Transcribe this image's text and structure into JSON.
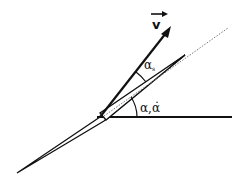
{
  "diagram": {
    "title": "",
    "labels": {
      "velocity": "v",
      "angle_slip": "α",
      "angle_slip_subscript": "s",
      "angle_attack": "α,α̇"
    },
    "colors": {
      "stroke": "#111111",
      "dash": "#777777",
      "background": "#ffffff"
    }
  }
}
